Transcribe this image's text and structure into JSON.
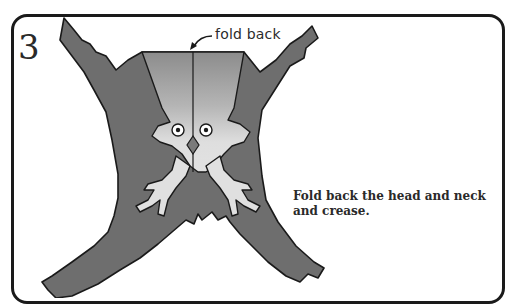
{
  "step": {
    "number": "3"
  },
  "figure": {
    "callout_label": "fold back",
    "colors": {
      "paper_dark": "#6f6f6f",
      "paper_mid": "#8a8a8a",
      "paper_light": "#d9d9d9",
      "outline": "#1a1a1a",
      "border": "#1a1a1a"
    }
  },
  "instruction": {
    "text": "Fold back the head and neck and crease."
  }
}
